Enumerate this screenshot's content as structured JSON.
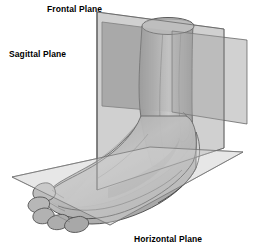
{
  "figure": {
    "background_color": "#ffffff",
    "width": 253,
    "height": 250
  },
  "labels": {
    "frontal": "Frontal Plane",
    "sagittal": "Sagittal Plane",
    "horizontal": "Horizontal Plane"
  },
  "planes": [
    {
      "id": "frontal",
      "label": "Frontal Plane",
      "orientation": "vertical, oriented front-to-back across the limb",
      "fill": "#9b9b9b",
      "fill_opacity": 0.55,
      "stroke": "#5a5a5a",
      "points": "102,22 247,40 247,124 102,105"
    },
    {
      "id": "sagittal",
      "label": "Sagittal Plane",
      "orientation": "vertical, running along the length of the foot",
      "fill": "#b4b4b4",
      "fill_opacity": 0.5,
      "stroke": "#5a5a5a",
      "points": "97,12 224,28 224,148 97,190"
    },
    {
      "id": "horizontal",
      "label": "Horizontal Plane",
      "orientation": "transverse, parallel to the ground beneath the foot",
      "fill": "#d2d2d2",
      "fill_opacity": 0.45,
      "stroke": "#6a6a6a",
      "points": "12,177 150,147 243,152 110,225"
    }
  ],
  "anatomy": {
    "leg": {
      "name": "lower leg shaft",
      "shape": "cylinder with elliptical top cross-section",
      "fill_light": "#c8c8c8",
      "fill_dark": "#8a8a8a"
    },
    "foot": {
      "name": "foot with five toes",
      "fill_light": "#c4c4c4",
      "fill_mid": "#aeaeae",
      "fill_dark": "#8f8f8f"
    },
    "outline_color": "#4a4a4a"
  },
  "palette": {
    "line": "#4a4a4a",
    "text": "#000000",
    "plane_light": "#d2d2d2",
    "plane_mid": "#b4b4b4",
    "plane_dark": "#9b9b9b",
    "tissue_light": "#c8c8c8",
    "tissue_dark": "#8a8a8a"
  }
}
